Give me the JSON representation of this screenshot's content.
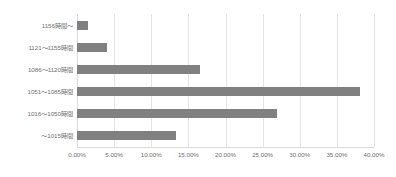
{
  "chart_data": {
    "type": "bar",
    "orientation": "horizontal",
    "title": "",
    "xlabel": "",
    "ylabel": "",
    "xlim": [
      0,
      40
    ],
    "xtick_values": [
      0,
      5,
      10,
      15,
      20,
      25,
      30,
      35,
      40
    ],
    "xtick_labels": [
      "0.00%",
      "5.00%",
      "10.00%",
      "15.00%",
      "20.00%",
      "25.00%",
      "30.00%",
      "35.00%",
      "40.00%"
    ],
    "value_unit": "%",
    "grid": "vertical",
    "legend": "none",
    "bar_color": "#808080",
    "grid_color": "#e4e4e4",
    "text_color": "#6f6f6f",
    "categories": [
      "1156時間〜",
      "1121〜1155時間",
      "1086〜1120時間",
      "1051〜1085時間",
      "1016〜1050時間",
      "〜1015時間"
    ],
    "values": [
      1.5,
      4.0,
      16.5,
      38.1,
      26.9,
      13.4
    ],
    "category_order": "top-to-bottom"
  }
}
